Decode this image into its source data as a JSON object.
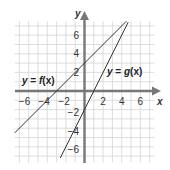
{
  "chart_data": {
    "type": "line",
    "title": "",
    "xlabel": "x",
    "ylabel": "y",
    "xlim": [
      -7.5,
      7.5
    ],
    "ylim": [
      -7.7,
      7.5
    ],
    "grid": true,
    "x_ticks": [
      -6,
      -4,
      -2,
      2,
      4,
      6
    ],
    "y_ticks": [
      6,
      4,
      2,
      -2,
      -4,
      -6
    ],
    "series": [
      {
        "name": "y = f(x)",
        "equation": "f(x) = x + 3",
        "slope": 1,
        "intercept": 3,
        "x": [
          -7.5,
          4.5
        ],
        "y": [
          -4.5,
          7.5
        ]
      },
      {
        "name": "y = g(x)",
        "equation": "g(x) = 2x - 2",
        "slope": 2,
        "intercept": -2,
        "x": [
          -2.6,
          4.7
        ],
        "y": [
          -7.2,
          7.4
        ]
      }
    ],
    "annotations": [
      {
        "text": "y = f(x)",
        "near": "left, above x-axis"
      },
      {
        "text": "y = g(x)",
        "near": "right of g line, upper right"
      }
    ]
  },
  "labels": {
    "x_axis": "x",
    "y_axis": "y",
    "f_label_y": "y",
    "f_label_eq": " = ",
    "f_label_fn": "f",
    "f_label_arg": "(x)",
    "g_label_y": "y",
    "g_label_eq": " = ",
    "g_label_fn": "g",
    "g_label_arg": "(x)",
    "x_ticks": [
      "−6",
      "−4",
      "−2",
      "2",
      "4",
      "6"
    ],
    "y_ticks": [
      "6",
      "4",
      "2",
      "−2",
      "−4",
      "−6"
    ]
  },
  "colors": {
    "grid": "#d4d4d4",
    "axis": "#777777",
    "line": "#333333",
    "text": "#333333"
  }
}
